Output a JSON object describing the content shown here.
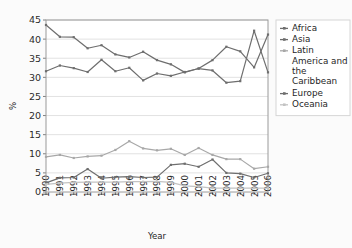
{
  "chart_data": {
    "type": "line",
    "title": "",
    "xlabel": "Year",
    "ylabel": "%",
    "x": [
      1990,
      1991,
      1992,
      1993,
      1994,
      1995,
      1996,
      1997,
      1998,
      1999,
      2000,
      2001,
      2002,
      2003,
      2004,
      2005,
      2006
    ],
    "xtick_labels": [
      "1990",
      "1991",
      "1992",
      "1993",
      "1994",
      "1995",
      "1996",
      "1997",
      "1998",
      "1999",
      "2000",
      "2001",
      "2002",
      "2003",
      "2004",
      "2005",
      "2006"
    ],
    "ytick_labels": [
      "0",
      "5",
      "10",
      "15",
      "20",
      "25",
      "30",
      "35",
      "40",
      "45"
    ],
    "yticks": [
      0,
      5,
      10,
      15,
      20,
      25,
      30,
      35,
      40,
      45
    ],
    "ylim": [
      0,
      45
    ],
    "xlim": [
      1990,
      2006
    ],
    "grid": "horizontal",
    "legend_position": "right",
    "series": [
      {
        "name": "Africa",
        "color": "#6e6e6e",
        "values": [
          43.7,
          40.6,
          40.5,
          37.6,
          38.4,
          36.0,
          35.2,
          36.7,
          34.5,
          33.4,
          31.3,
          32.3,
          31.8,
          28.6,
          29.0,
          42.2,
          31.3
        ]
      },
      {
        "name": "Asia",
        "color": "#6e6e6e",
        "values": [
          31.6,
          33.1,
          32.4,
          31.4,
          34.6,
          31.6,
          32.5,
          29.2,
          31.0,
          30.4,
          31.4,
          32.3,
          34.5,
          38.0,
          36.8,
          32.6,
          41.2
        ]
      },
      {
        "name": "Latin America and the Caribbean",
        "color": "#a8a8a8",
        "values": [
          9.2,
          9.7,
          8.9,
          9.3,
          9.5,
          11.0,
          13.3,
          11.4,
          10.9,
          11.3,
          9.7,
          11.5,
          9.7,
          8.6,
          8.6,
          6.1,
          6.6
        ]
      },
      {
        "name": "Europe",
        "color": "#6e6e6e",
        "values": [
          2.4,
          3.7,
          3.8,
          6.0,
          3.6,
          3.9,
          4.0,
          3.8,
          3.9,
          7.1,
          7.4,
          6.6,
          8.5,
          5.0,
          4.8,
          3.8,
          4.9
        ]
      },
      {
        "name": "Oceania",
        "color": "#c3c3c3",
        "values": [
          2.0,
          2.3,
          2.5,
          2.6,
          2.6,
          2.6,
          2.7,
          2.7,
          2.8,
          2.5,
          1.6,
          1.4,
          1.0,
          1.0,
          1.0,
          1.0,
          1.0
        ]
      }
    ]
  },
  "legend": {
    "entries": [
      {
        "label": "Africa"
      },
      {
        "label": "Asia"
      },
      {
        "label": "Latin America and the Caribbean"
      },
      {
        "label": "Europe"
      },
      {
        "label": "Oceania"
      }
    ]
  }
}
